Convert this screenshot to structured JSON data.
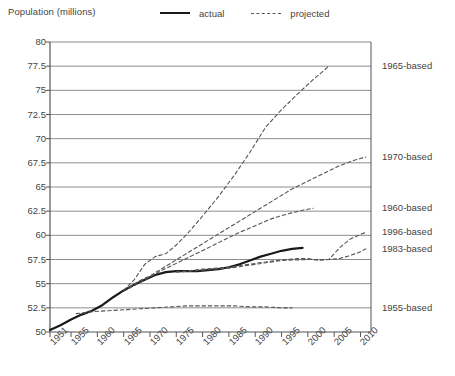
{
  "chart_data": {
    "type": "line",
    "title": "",
    "ylabel": "Population (millions)",
    "xlabel": "",
    "ylim": [
      50,
      80
    ],
    "yticks": [
      50,
      52.5,
      55,
      57.5,
      60,
      62.5,
      65,
      67.5,
      70,
      72.5,
      75,
      77.5,
      80
    ],
    "ytick_labels": [
      "50",
      "52.5",
      "55",
      "57.5",
      "60",
      "62.5",
      "65",
      "67.5",
      "70",
      "72.5",
      "75",
      "77.5",
      "80"
    ],
    "xlim": [
      1951,
      2012
    ],
    "xticks": [
      1951,
      1955,
      1960,
      1965,
      1970,
      1975,
      1980,
      1985,
      1990,
      1995,
      2000,
      2005,
      2010
    ],
    "xtick_labels": [
      "1951",
      "1955",
      "1960",
      "1965",
      "1970",
      "1975",
      "1980",
      "1985",
      "1990",
      "1995",
      "2000",
      "2005",
      "2010"
    ],
    "grid": "horizontal",
    "legend_position": "top",
    "legend": [
      {
        "label": "actual",
        "style": "solid",
        "icon": "solid-line-swatch"
      },
      {
        "label": "projected",
        "style": "dashed",
        "icon": "dashed-line-swatch"
      }
    ],
    "series": [
      {
        "name": "actual",
        "style": "solid",
        "points": [
          [
            1951,
            50.2
          ],
          [
            1953,
            50.7
          ],
          [
            1955,
            51.3
          ],
          [
            1957,
            51.8
          ],
          [
            1959,
            52.2
          ],
          [
            1961,
            52.8
          ],
          [
            1963,
            53.6
          ],
          [
            1965,
            54.3
          ],
          [
            1967,
            54.9
          ],
          [
            1969,
            55.4
          ],
          [
            1971,
            55.9
          ],
          [
            1973,
            56.2
          ],
          [
            1975,
            56.3
          ],
          [
            1977,
            56.3
          ],
          [
            1979,
            56.3
          ],
          [
            1981,
            56.4
          ],
          [
            1983,
            56.5
          ],
          [
            1985,
            56.7
          ],
          [
            1987,
            57.0
          ],
          [
            1989,
            57.4
          ],
          [
            1991,
            57.8
          ],
          [
            1993,
            58.1
          ],
          [
            1995,
            58.4
          ],
          [
            1997,
            58.6
          ],
          [
            1999,
            58.7
          ]
        ]
      },
      {
        "name": "1965-based",
        "style": "dashed",
        "right_label": "1965-based",
        "points": [
          [
            1965,
            54.3
          ],
          [
            1967,
            55.4
          ],
          [
            1969,
            57.0
          ],
          [
            1971,
            57.8
          ],
          [
            1973,
            58.1
          ],
          [
            1975,
            59.0
          ],
          [
            1977,
            60.1
          ],
          [
            1980,
            62.0
          ],
          [
            1983,
            64.0
          ],
          [
            1986,
            66.2
          ],
          [
            1989,
            68.6
          ],
          [
            1992,
            71.2
          ],
          [
            1995,
            73.0
          ],
          [
            1998,
            74.6
          ],
          [
            2001,
            76.1
          ],
          [
            2004,
            77.5
          ]
        ]
      },
      {
        "name": "1970-based",
        "style": "dashed",
        "right_label": "1970-based",
        "points": [
          [
            1966,
            54.6
          ],
          [
            1968,
            55.3
          ],
          [
            1970,
            55.8
          ],
          [
            1973,
            56.8
          ],
          [
            1976,
            57.8
          ],
          [
            1979,
            58.8
          ],
          [
            1982,
            59.8
          ],
          [
            1985,
            60.8
          ],
          [
            1988,
            61.8
          ],
          [
            1991,
            62.8
          ],
          [
            1994,
            63.8
          ],
          [
            1997,
            64.8
          ],
          [
            2000,
            65.6
          ],
          [
            2003,
            66.4
          ],
          [
            2006,
            67.2
          ],
          [
            2009,
            67.8
          ],
          [
            2011,
            68.1
          ]
        ]
      },
      {
        "name": "1960-based",
        "style": "dashed",
        "right_label": "1960-based",
        "points": [
          [
            1966,
            54.5
          ],
          [
            1969,
            55.4
          ],
          [
            1972,
            56.3
          ],
          [
            1975,
            57.1
          ],
          [
            1978,
            57.9
          ],
          [
            1981,
            58.7
          ],
          [
            1984,
            59.5
          ],
          [
            1987,
            60.3
          ],
          [
            1990,
            61.0
          ],
          [
            1993,
            61.7
          ],
          [
            1996,
            62.2
          ],
          [
            1999,
            62.6
          ],
          [
            2001,
            62.8
          ]
        ]
      },
      {
        "name": "1996-based",
        "style": "dashed",
        "right_label": "1996-based",
        "points": [
          [
            1975,
            56.2
          ],
          [
            1980,
            56.5
          ],
          [
            1985,
            56.7
          ],
          [
            1990,
            57.1
          ],
          [
            1994,
            57.4
          ],
          [
            1996,
            57.5
          ],
          [
            1998,
            57.6
          ],
          [
            2000,
            57.6
          ],
          [
            2002,
            57.4
          ],
          [
            2004,
            57.5
          ],
          [
            2006,
            58.7
          ],
          [
            2008,
            59.6
          ],
          [
            2010,
            60.1
          ],
          [
            2011,
            60.3
          ]
        ]
      },
      {
        "name": "1983-based",
        "style": "dashed",
        "right_label": "1983-based",
        "points": [
          [
            1975,
            56.2
          ],
          [
            1980,
            56.4
          ],
          [
            1985,
            56.6
          ],
          [
            1990,
            57.0
          ],
          [
            1995,
            57.4
          ],
          [
            2000,
            57.5
          ],
          [
            2004,
            57.5
          ],
          [
            2006,
            57.6
          ],
          [
            2008,
            57.9
          ],
          [
            2010,
            58.3
          ],
          [
            2011,
            58.6
          ]
        ]
      },
      {
        "name": "1955-based",
        "style": "dashed",
        "right_label": "1955-based",
        "points": [
          [
            1956,
            51.9
          ],
          [
            1959,
            52.1
          ],
          [
            1962,
            52.2
          ],
          [
            1965,
            52.3
          ],
          [
            1968,
            52.4
          ],
          [
            1971,
            52.5
          ],
          [
            1974,
            52.6
          ],
          [
            1977,
            52.7
          ],
          [
            1980,
            52.7
          ],
          [
            1983,
            52.7
          ],
          [
            1986,
            52.7
          ],
          [
            1989,
            52.6
          ],
          [
            1992,
            52.6
          ],
          [
            1995,
            52.5
          ],
          [
            1997,
            52.5
          ]
        ]
      }
    ],
    "right_labels": [
      {
        "label": "1965-based",
        "y_value": 77.5
      },
      {
        "label": "1970-based",
        "y_value": 68.1
      },
      {
        "label": "1960-based",
        "y_value": 62.8
      },
      {
        "label": "1996-based",
        "y_value": 60.3
      },
      {
        "label": "1983-based",
        "y_value": 58.6
      },
      {
        "label": "1955-based",
        "y_value": 52.5
      }
    ],
    "colors": {
      "actual_line": "#1a1a1a",
      "projected_line": "#555555",
      "grid": "#808080",
      "axis": "#555555",
      "text": "#3a3a3a",
      "background": "#ffffff"
    }
  }
}
